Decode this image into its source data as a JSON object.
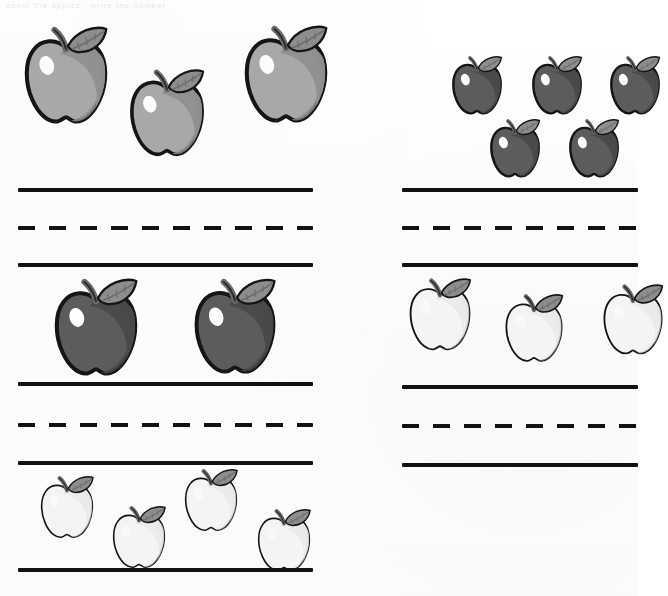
{
  "worksheet": {
    "title": "Apple Counting Worksheet",
    "header_ghost_text": "count the apples  ·  write the number",
    "background_color": "#fdfdfd",
    "page_width": 638,
    "page_height": 596
  },
  "palette": {
    "ink": "#121212",
    "apple_medium_fill": "#a8a8a8",
    "apple_medium_shadow": "#8f8f8f",
    "apple_dark_fill": "#5c5c5c",
    "apple_dark_shadow": "#494949",
    "apple_light_fill": "#f4f4f4",
    "apple_light_shadow": "#e4e4e4",
    "leaf_fill": "#8d8d8d",
    "leaf_shadow": "#6f6f6f",
    "stem_fill": "#6a6a6a",
    "highlight": "#ffffff",
    "outline": "#151515"
  },
  "line_rules": {
    "solid_label": "solid-baseline",
    "dashed_label": "dashed-midline",
    "dash_length_px": 17,
    "dash_gap_px": 14,
    "stroke_thickness_px": 4
  },
  "columns": [
    {
      "id": "left",
      "name": "left-column",
      "x": 0,
      "width": 330,
      "line_start_x": 18,
      "line_end_x": 313,
      "groups": [
        {
          "id": "left-group-1",
          "name": "apple-group-gray-three",
          "count": 3,
          "apple_shade": "medium",
          "answer_blank": true,
          "apples": [
            {
              "x": 18,
              "y": 25,
              "size": 96,
              "shade": "medium"
            },
            {
              "x": 124,
              "y": 68,
              "size": 86,
              "shade": "medium"
            },
            {
              "x": 238,
              "y": 24,
              "size": 96,
              "shade": "medium"
            }
          ],
          "ruleset": {
            "solid_top_y": 188,
            "dashed_mid_y": 226,
            "solid_bottom_y": 263
          }
        },
        {
          "id": "left-group-2",
          "name": "apple-group-dark-two",
          "count": 2,
          "apple_shade": "dark",
          "answer_blank": true,
          "apples": [
            {
              "x": 48,
              "y": 277,
              "size": 96,
              "shade": "dark"
            },
            {
              "x": 188,
              "y": 277,
              "size": 94,
              "shade": "dark"
            }
          ],
          "ruleset": {
            "solid_top_y": 382,
            "dashed_mid_y": 423,
            "solid_bottom_y": 461
          }
        },
        {
          "id": "left-group-3",
          "name": "apple-group-light-four",
          "count": 4,
          "apple_shade": "light",
          "answer_blank": false,
          "apples": [
            {
              "x": 36,
              "y": 475,
              "size": 62,
              "shade": "light"
            },
            {
              "x": 108,
              "y": 505,
              "size": 62,
              "shade": "light"
            },
            {
              "x": 180,
              "y": 468,
              "size": 62,
              "shade": "light"
            },
            {
              "x": 253,
              "y": 508,
              "size": 62,
              "shade": "light"
            }
          ],
          "ruleset": {
            "solid_bottom_y": 568
          }
        }
      ]
    },
    {
      "id": "right",
      "name": "right-column",
      "x": 330,
      "width": 308,
      "line_start_x": 402,
      "line_end_x": 638,
      "groups": [
        {
          "id": "right-group-1",
          "name": "apple-group-dark-five",
          "count": 5,
          "apple_shade": "dark",
          "answer_blank": true,
          "clipped_right_edge": true,
          "apples": [
            {
              "x": 448,
              "y": 55,
              "size": 58,
              "shade": "dark"
            },
            {
              "x": 528,
              "y": 55,
              "size": 58,
              "shade": "dark"
            },
            {
              "x": 606,
              "y": 55,
              "size": 58,
              "shade": "dark"
            },
            {
              "x": 486,
              "y": 118,
              "size": 58,
              "shade": "dark"
            },
            {
              "x": 565,
              "y": 118,
              "size": 58,
              "shade": "dark"
            }
          ],
          "ruleset": {
            "solid_top_y": 188,
            "dashed_mid_y": 226,
            "solid_bottom_y": 263
          }
        },
        {
          "id": "right-group-2",
          "name": "apple-group-light-three",
          "count": 3,
          "apple_shade": "light",
          "answer_blank": true,
          "clipped_right_edge": true,
          "apples": [
            {
              "x": 404,
              "y": 277,
              "size": 72,
              "shade": "light"
            },
            {
              "x": 500,
              "y": 293,
              "size": 68,
              "shade": "light"
            },
            {
              "x": 598,
              "y": 283,
              "size": 70,
              "shade": "light"
            }
          ],
          "ruleset": {
            "solid_top_y": 385,
            "dashed_mid_y": 424,
            "solid_bottom_y": 463
          }
        }
      ]
    }
  ],
  "chart_data": {
    "type": "table",
    "columns": [
      "group",
      "column",
      "apple_shade",
      "apple_count"
    ],
    "rows": [
      [
        "left-group-1",
        "left",
        "medium gray",
        3
      ],
      [
        "left-group-2",
        "left",
        "dark gray",
        2
      ],
      [
        "left-group-3",
        "left",
        "light / white",
        4
      ],
      [
        "right-group-1",
        "right",
        "dark gray",
        5
      ],
      [
        "right-group-2",
        "right",
        "light / white",
        3
      ]
    ]
  }
}
